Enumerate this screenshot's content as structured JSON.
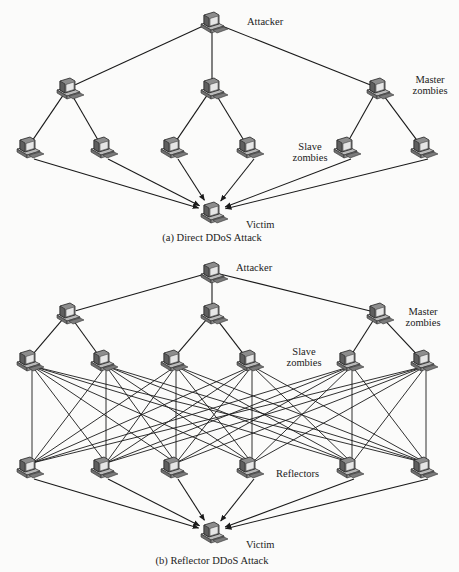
{
  "panels": [
    {
      "id": "a",
      "caption": "(a) Direct DDoS Attack",
      "labels": {
        "attacker": "Attacker",
        "master": [
          "Master",
          "zombies"
        ],
        "slave": [
          "Slave",
          "zombies"
        ],
        "victim": "Victim"
      },
      "nodes": {
        "attacker": [
          212,
          22
        ],
        "masters": [
          [
            68,
            88
          ],
          [
            212,
            88
          ],
          [
            378,
            88
          ]
        ],
        "slaves": [
          [
            28,
            147
          ],
          [
            102,
            147
          ],
          [
            172,
            147
          ],
          [
            248,
            147
          ],
          [
            345,
            147
          ],
          [
            422,
            147
          ]
        ],
        "victim": [
          212,
          212
        ]
      }
    },
    {
      "id": "b",
      "caption": "(b) Reflector DDoS Attack",
      "labels": {
        "attacker": "Attacker",
        "master": [
          "Master",
          "zombies"
        ],
        "slave": [
          "Slave",
          "zombies"
        ],
        "reflectors": "Reflectors",
        "victim": "Victim"
      },
      "nodes": {
        "attacker": [
          212,
          272
        ],
        "masters": [
          [
            68,
            313
          ],
          [
            212,
            313
          ],
          [
            378,
            313
          ]
        ],
        "slaves": [
          [
            28,
            360
          ],
          [
            102,
            360
          ],
          [
            172,
            360
          ],
          [
            248,
            360
          ],
          [
            348,
            360
          ],
          [
            422,
            360
          ]
        ],
        "reflectors": [
          [
            28,
            467
          ],
          [
            102,
            467
          ],
          [
            172,
            467
          ],
          [
            248,
            467
          ],
          [
            348,
            467
          ],
          [
            422,
            467
          ]
        ],
        "victim": [
          212,
          532
        ]
      }
    }
  ],
  "colors": {
    "line": "#1a1a1a",
    "text": "#222222",
    "background": "#fbfbfa"
  }
}
